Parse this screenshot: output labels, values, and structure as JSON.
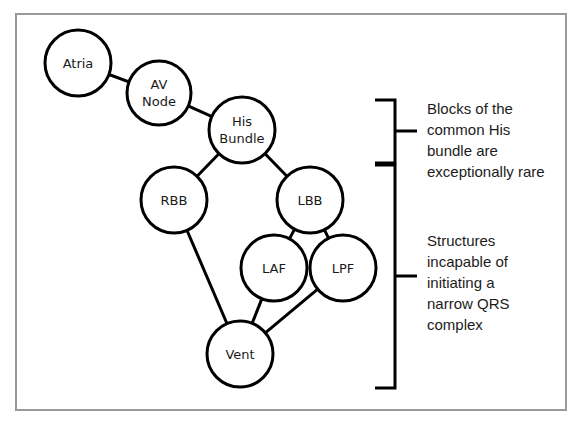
{
  "diagram": {
    "frame": {
      "stroke_color": "#9a9a9a"
    },
    "node_style": {
      "fill": "#ffffff",
      "stroke": "#000000",
      "radius": 33
    },
    "nodes": [
      {
        "id": "atria",
        "label": "Atria",
        "cx": 78,
        "cy": 63,
        "r": 33,
        "lines": [
          "Atria"
        ]
      },
      {
        "id": "av-node",
        "label": "AV Node",
        "cx": 159,
        "cy": 93,
        "r": 32,
        "lines": [
          "AV",
          "Node"
        ]
      },
      {
        "id": "his-bundle",
        "label": "His Bundle",
        "cx": 242,
        "cy": 130,
        "r": 33,
        "lines": [
          "His",
          "Bundle"
        ]
      },
      {
        "id": "rbb",
        "label": "RBB",
        "cx": 174,
        "cy": 200,
        "r": 33,
        "lines": [
          "RBB"
        ]
      },
      {
        "id": "lbb",
        "label": "LBB",
        "cx": 310,
        "cy": 200,
        "r": 33,
        "lines": [
          "LBB"
        ]
      },
      {
        "id": "laf",
        "label": "LAF",
        "cx": 274,
        "cy": 268,
        "r": 33,
        "lines": [
          "LAF"
        ]
      },
      {
        "id": "lpf",
        "label": "LPF",
        "cx": 343,
        "cy": 268,
        "r": 33,
        "lines": [
          "LPF"
        ]
      },
      {
        "id": "vent",
        "label": "Vent",
        "cx": 240,
        "cy": 354,
        "r": 33,
        "lines": [
          "Vent"
        ]
      }
    ],
    "edges": [
      {
        "from": "atria",
        "to": "av-node"
      },
      {
        "from": "av-node",
        "to": "his-bundle"
      },
      {
        "from": "his-bundle",
        "to": "rbb"
      },
      {
        "from": "his-bundle",
        "to": "lbb"
      },
      {
        "from": "lbb",
        "to": "laf"
      },
      {
        "from": "lbb",
        "to": "lpf"
      },
      {
        "from": "rbb",
        "to": "vent"
      },
      {
        "from": "laf",
        "to": "vent"
      },
      {
        "from": "lpf",
        "to": "vent"
      }
    ],
    "brackets": [
      {
        "id": "bracket-upper",
        "x": 395,
        "y_top": 100,
        "y_bottom": 163,
        "tick_y": 131,
        "arm": 20,
        "tick_len": 22,
        "annotation": "Blocks of the\ncommon His\nbundle are\nexceptionally rare"
      },
      {
        "id": "bracket-lower",
        "x": 395,
        "y_top": 165,
        "y_bottom": 388,
        "tick_y": 276,
        "arm": 20,
        "tick_len": 22,
        "annotation": "Structures\nincapable of\ninitiating a\nnarrow QRS\ncomplex"
      }
    ]
  }
}
